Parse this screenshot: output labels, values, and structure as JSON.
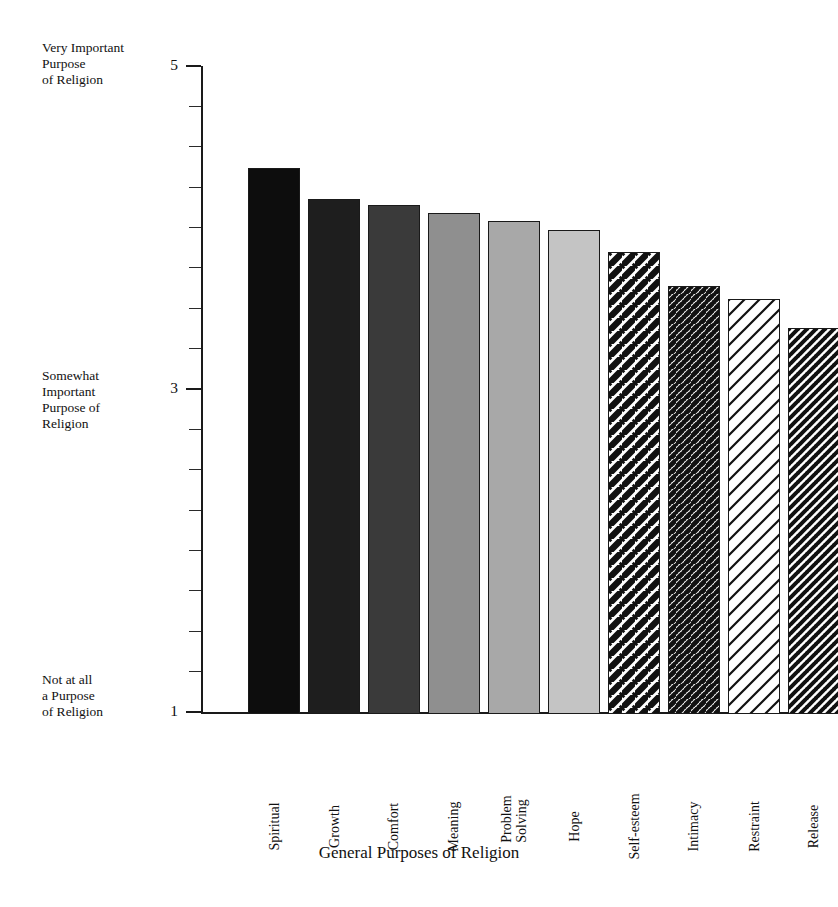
{
  "chart_data": {
    "type": "bar",
    "title": "",
    "xlabel": "General Purposes of Religion",
    "ylabel": "",
    "ylim": [
      1,
      5
    ],
    "grid": false,
    "legend": "none",
    "categories": [
      "Spiritual",
      "Growth",
      "Comfort",
      "Meaning",
      "Problem\nSolving",
      "Hope",
      "Self-esteem",
      "Intimacy",
      "Restraint",
      "Release"
    ],
    "values": [
      4.38,
      4.19,
      4.15,
      4.1,
      4.05,
      4.0,
      3.86,
      3.65,
      3.57,
      3.39
    ],
    "y_tick_values": [
      1,
      3,
      5
    ],
    "y_tick_labels": [
      "1",
      "3",
      "5"
    ],
    "y_minor_tick_step": 0.25,
    "y_axis_anchor_labels": {
      "high": "Very Important\nPurpose\nof Religion",
      "mid": "Somewhat\nImportant\nPurpose of\nReligion",
      "low": "Not at all\na Purpose\nof Religion"
    },
    "bar_styles": [
      {
        "name": "Spiritual",
        "fill": "#0d0d0d",
        "pattern": "solid"
      },
      {
        "name": "Growth",
        "fill": "#1e1e1e",
        "pattern": "solid"
      },
      {
        "name": "Comfort",
        "fill": "#3a3a3a",
        "pattern": "solid"
      },
      {
        "name": "Meaning",
        "fill": "#8f8f8f",
        "pattern": "solid"
      },
      {
        "name": "Problem Solving",
        "fill": "#a8a8a8",
        "pattern": "solid"
      },
      {
        "name": "Hope",
        "fill": "#c4c4c4",
        "pattern": "solid"
      },
      {
        "name": "Self-esteem",
        "fill": "#ffffff",
        "pattern": "diagonal-thick"
      },
      {
        "name": "Intimacy",
        "fill": "#ffffff",
        "pattern": "diagonal-dense"
      },
      {
        "name": "Restraint",
        "fill": "#ffffff",
        "pattern": "diagonal-sparse"
      },
      {
        "name": "Release",
        "fill": "#ffffff",
        "pattern": "diagonal-medium"
      }
    ]
  },
  "colors": {
    "axis": "#1a1a1a",
    "text": "#111111",
    "background": "#ffffff"
  }
}
